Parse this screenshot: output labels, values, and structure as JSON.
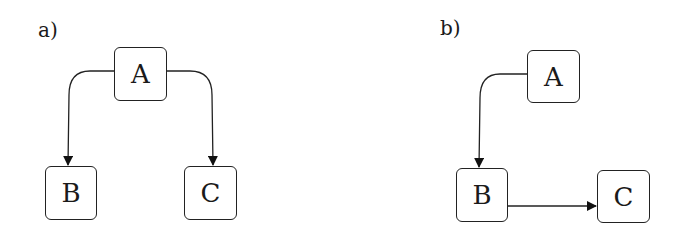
{
  "panels": [
    {
      "label": "a)",
      "nodes": {
        "A": "A",
        "B": "B",
        "C": "C"
      },
      "edges": [
        {
          "from": "A",
          "to": "B",
          "style": "curved"
        },
        {
          "from": "A",
          "to": "C",
          "style": "curved"
        }
      ]
    },
    {
      "label": "b)",
      "nodes": {
        "A": "A",
        "B": "B",
        "C": "C"
      },
      "edges": [
        {
          "from": "A",
          "to": "B",
          "style": "curved"
        },
        {
          "from": "B",
          "to": "C",
          "style": "straight"
        }
      ]
    }
  ],
  "colors": {
    "stroke": "#222222",
    "background": "#ffffff"
  }
}
